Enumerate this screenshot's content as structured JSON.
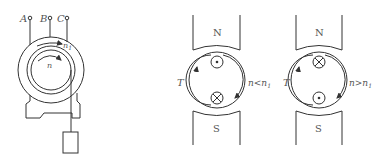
{
  "figure": {
    "left": {
      "terminals": [
        "A",
        "B",
        "C"
      ],
      "stator_speed_label": "n",
      "stator_speed_sub": "1",
      "rotor_speed_label": "n"
    },
    "middle": {
      "pole_top": "N",
      "pole_bottom": "S",
      "torque_label": "T",
      "condition_n": "n",
      "condition_op": "<",
      "condition_n1": "n",
      "condition_sub": "1",
      "top_conductor": "dot",
      "bottom_conductor": "cross"
    },
    "right": {
      "pole_top": "N",
      "pole_bottom": "S",
      "torque_label": "T",
      "condition_n": "n",
      "condition_op": ">",
      "condition_n1": "n",
      "condition_sub": "1",
      "top_conductor": "cross",
      "bottom_conductor": "dot"
    }
  },
  "colors": {
    "line": "#333333",
    "text": "#555555"
  }
}
